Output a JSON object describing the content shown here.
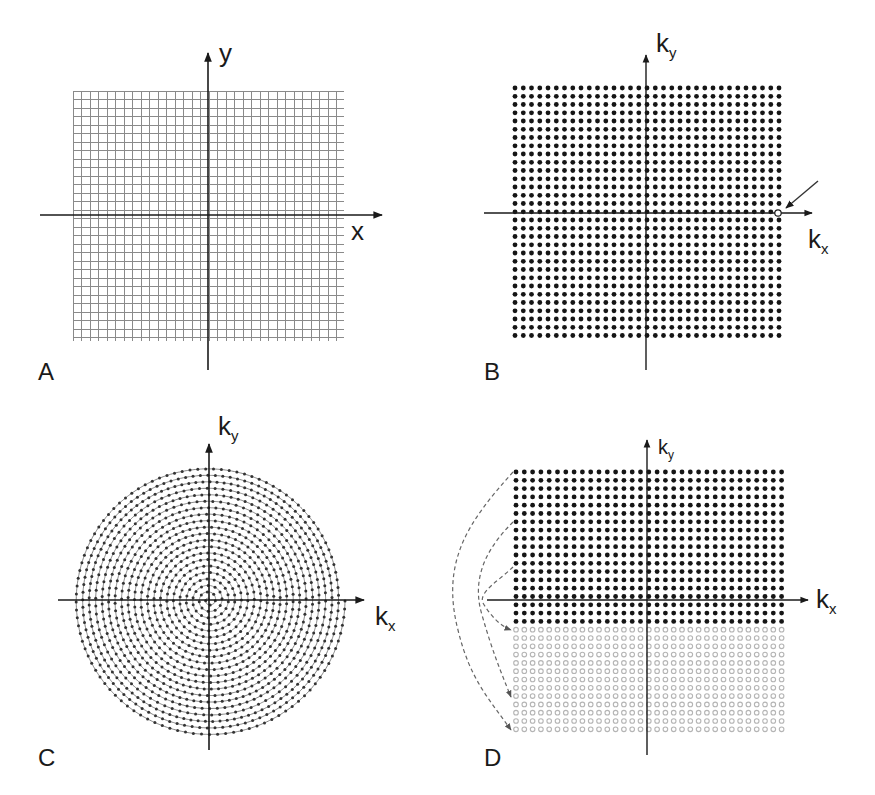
{
  "figure": {
    "panels": [
      {
        "id": "A",
        "letter": "A",
        "kind": "image-space-grid",
        "x_label": "x",
        "y_label": "y",
        "grid": {
          "x0": 73,
          "y0": 91,
          "x1": 344,
          "y1": 341,
          "step": 8.5,
          "color": "#8a8a8a"
        },
        "axes": {
          "cx": 208,
          "cy": 215,
          "x_from": 40,
          "x_to": 382,
          "y_from": 53,
          "y_to": 370
        }
      },
      {
        "id": "B",
        "letter": "B",
        "kind": "cartesian-kspace",
        "x_label": "k",
        "x_sub": "x",
        "y_label": "k",
        "y_sub": "y",
        "dots": {
          "x0": 515,
          "y0": 88,
          "cols": 33,
          "rows": 31,
          "step": 8.25,
          "r": 2.4,
          "color": "#151515"
        },
        "highlight_point": {
          "x": 778,
          "y": 213,
          "style": "open-circle"
        },
        "arrow": {
          "from": [
            818,
            181
          ],
          "to": [
            786,
            208
          ]
        },
        "axes": {
          "cx": 646,
          "cy": 213,
          "x_from": 484,
          "x_to": 812,
          "y_from": 55,
          "y_to": 370
        }
      },
      {
        "id": "C",
        "letter": "C",
        "kind": "spiral-kspace",
        "x_label": "k",
        "x_sub": "x",
        "y_label": "k",
        "y_sub": "y",
        "spiral": {
          "cx": 209,
          "cy": 600,
          "r_max": 136,
          "turns": 21,
          "dot_spacing": 7,
          "color": "#333333"
        },
        "axes": {
          "cx": 209,
          "cy": 600,
          "x_from": 58,
          "x_to": 364,
          "y_from": 444,
          "y_to": 750
        }
      },
      {
        "id": "D",
        "letter": "D",
        "kind": "partial-fourier-kspace",
        "x_label": "k",
        "x_sub": "x",
        "y_label": "k",
        "y_sub": "y",
        "acquired_dots": {
          "x0": 516,
          "y0": 472,
          "cols": 33,
          "rows": 19,
          "step": 8.3,
          "r": 2.4,
          "color": "#151515"
        },
        "synthesized_dots": {
          "x0": 516,
          "rows": 13,
          "color": "#b5b5b5"
        },
        "axes": {
          "cx": 647,
          "cy": 600,
          "x_from": 487,
          "x_to": 808,
          "y_from": 440,
          "y_to": 755
        },
        "symmetry_arrows_label": "conjugate symmetry mapping (dashed)"
      }
    ]
  }
}
